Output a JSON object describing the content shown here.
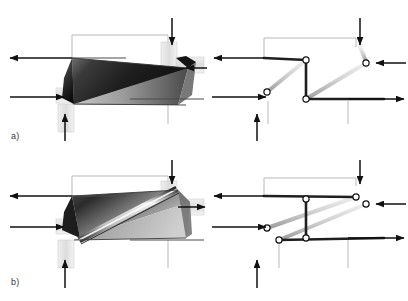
{
  "figure": {
    "background_color": "#ffffff",
    "width": 408,
    "height": 301,
    "panels": [
      {
        "id": "a",
        "label": "a)",
        "label_x": 11,
        "label_y": 131,
        "views": [
          {
            "id": "a-solid",
            "kind": "shaded-solid-body",
            "description": "Parallelogram block with dark-to-light gradient shading split by a diagonal edge, with four guide rails and four load arrows"
          },
          {
            "id": "a-skeleton",
            "kind": "kinematic-skeleton",
            "description": "Z-shaped link chain: upper horizontal bar, central vertical bar, lower horizontal bar, with two light diagonal struts and three pin joints"
          }
        ],
        "arrows": [
          {
            "name": "arrow-left-out-top",
            "direction": "left",
            "x1": 72,
            "y1": 58,
            "x2": 8,
            "y2": 58
          },
          {
            "name": "arrow-left-in-bottom",
            "direction": "right",
            "x1": 8,
            "y1": 97,
            "x2": 66,
            "y2": 97
          },
          {
            "name": "arrow-top-down",
            "direction": "down",
            "x1": 172,
            "y1": 18,
            "x2": 172,
            "y2": 47
          },
          {
            "name": "arrow-bottom-up",
            "direction": "up",
            "x1": 65,
            "y1": 141,
            "x2": 65,
            "y2": 112
          },
          {
            "name": "arrow-right-in",
            "direction": "left",
            "x1": 205,
            "y1": 68,
            "x2": 186,
            "y2": 68
          },
          {
            "name": "arrow-skel-left-out-top",
            "direction": "left",
            "x1": 264,
            "y1": 58,
            "x2": 212,
            "y2": 58
          },
          {
            "name": "arrow-skel-left-in-bottom",
            "direction": "right",
            "x1": 212,
            "y1": 97,
            "x2": 268,
            "y2": 97
          },
          {
            "name": "arrow-skel-top-down",
            "direction": "down",
            "x1": 360,
            "y1": 18,
            "x2": 360,
            "y2": 47
          },
          {
            "name": "arrow-skel-bottom-up",
            "direction": "up",
            "x1": 257,
            "y1": 141,
            "x2": 257,
            "y2": 112
          },
          {
            "name": "arrow-skel-right-in",
            "direction": "left",
            "x1": 404,
            "y1": 58,
            "x2": 374,
            "y2": 58
          },
          {
            "name": "arrow-skel-right-out",
            "direction": "right",
            "x1": 348,
            "y1": 97,
            "x2": 404,
            "y2": 97
          }
        ],
        "joints": [
          {
            "name": "joint-upper",
            "x": 306,
            "y": 60
          },
          {
            "name": "joint-lower",
            "x": 306,
            "y": 99
          },
          {
            "name": "joint-left",
            "x": 267,
            "y": 92
          },
          {
            "name": "joint-right",
            "x": 366,
            "y": 63
          }
        ]
      },
      {
        "id": "b",
        "label": "b)",
        "label_x": 11,
        "label_y": 277,
        "views": [
          {
            "id": "b-solid",
            "kind": "shaded-solid-body",
            "description": "Parallelogram block with gradient shading crossed by a bright diagonal strut running from lower-left to upper-right"
          },
          {
            "id": "b-skeleton",
            "kind": "kinematic-skeleton",
            "description": "Triangulated link chain with two light diagonal struts forming a braced frame and four pin joints"
          }
        ],
        "arrows": [
          {
            "name": "arrow-left-out-top",
            "direction": "left",
            "x1": 72,
            "y1": 196,
            "x2": 8,
            "y2": 196
          },
          {
            "name": "arrow-left-in-bottom",
            "direction": "right",
            "x1": 8,
            "y1": 227,
            "x2": 66,
            "y2": 227
          },
          {
            "name": "arrow-top-down",
            "direction": "down",
            "x1": 172,
            "y1": 160,
            "x2": 172,
            "y2": 186
          },
          {
            "name": "arrow-bottom-up",
            "direction": "up",
            "x1": 65,
            "y1": 288,
            "x2": 65,
            "y2": 258
          },
          {
            "name": "arrow-right-in",
            "direction": "right",
            "x1": 178,
            "y1": 207,
            "x2": 205,
            "y2": 207
          },
          {
            "name": "arrow-skel-left-out-top",
            "direction": "left",
            "x1": 264,
            "y1": 196,
            "x2": 212,
            "y2": 196
          },
          {
            "name": "arrow-skel-left-in-bottom",
            "direction": "right",
            "x1": 212,
            "y1": 227,
            "x2": 268,
            "y2": 227
          },
          {
            "name": "arrow-skel-top-down",
            "direction": "down",
            "x1": 360,
            "y1": 160,
            "x2": 360,
            "y2": 186
          },
          {
            "name": "arrow-skel-bottom-up",
            "direction": "up",
            "x1": 257,
            "y1": 288,
            "x2": 257,
            "y2": 258
          },
          {
            "name": "arrow-skel-right-in",
            "direction": "left",
            "x1": 404,
            "y1": 204,
            "x2": 374,
            "y2": 204
          },
          {
            "name": "arrow-skel-right-out",
            "direction": "right",
            "x1": 348,
            "y1": 237,
            "x2": 404,
            "y2": 237
          }
        ],
        "joints": [
          {
            "name": "joint-upper-mid",
            "x": 306,
            "y": 199
          },
          {
            "name": "joint-lower-mid",
            "x": 306,
            "y": 238
          },
          {
            "name": "joint-left",
            "x": 267,
            "y": 228
          },
          {
            "name": "joint-lower-left",
            "x": 279,
            "y": 240
          },
          {
            "name": "joint-upper-right",
            "x": 356,
            "y": 197
          },
          {
            "name": "joint-right",
            "x": 366,
            "y": 204
          }
        ]
      }
    ],
    "colors": {
      "arrow": "#1a1a1a",
      "link_dark": "#262626",
      "link_light": "#d8d8d8",
      "rail": "#b8b8b8",
      "joint_fill": "#ffffff",
      "joint_stroke": "#1a1a1a",
      "body_dark": "#242424",
      "body_mid": "#808080",
      "body_light": "#d4d4d4",
      "label": "#3a3a3a"
    }
  }
}
